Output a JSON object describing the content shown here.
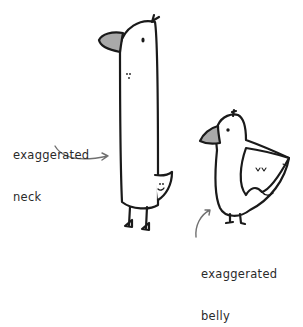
{
  "illustration": {
    "subject": "two cartoon birds",
    "labels": {
      "neck_line1": "exaggerated",
      "neck_line2": "neck",
      "belly_line1": "exaggerated",
      "belly_line2": "belly"
    },
    "colors": {
      "background": "#ffffff",
      "outline": "#1a1a1a",
      "beak_fill": "#a9a9a9",
      "arrow": "#707070",
      "text": "#2a2a2a"
    }
  }
}
